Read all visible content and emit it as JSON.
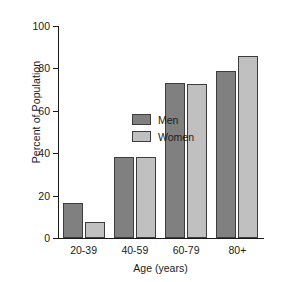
{
  "chart_data": {
    "type": "bar",
    "title": "",
    "subtitle": "",
    "xlabel": "Age (years)",
    "ylabel": "Percent of Population",
    "categories": [
      "20-39",
      "40-59",
      "60-79",
      "80+"
    ],
    "series": [
      {
        "name": "Men",
        "color": "#808080",
        "values": [
          16.5,
          38.0,
          73.0,
          79.0
        ]
      },
      {
        "name": "Women",
        "color": "#c0c0c0",
        "values": [
          7.5,
          38.0,
          72.5,
          86.0
        ]
      }
    ],
    "ylim": [
      0,
      100
    ],
    "yticks": [
      0,
      20,
      40,
      60,
      80,
      100
    ],
    "ytick_labels": [
      "0",
      "20",
      "40",
      "60",
      "80",
      "100"
    ],
    "grid": false,
    "legend_position": "upper-left-inside",
    "bar_edge_color": "#3d3d3d",
    "axis_color": "#1a1a1a",
    "background": "#ffffff"
  }
}
